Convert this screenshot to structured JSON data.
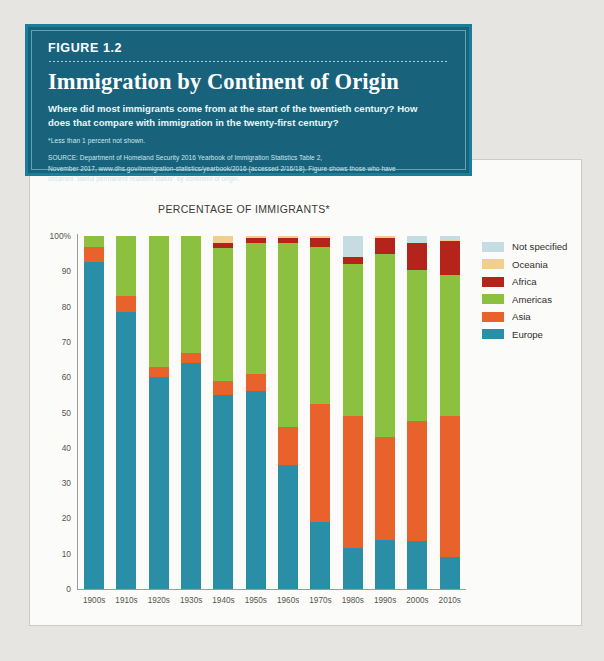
{
  "header": {
    "figure_label": "FIGURE 1.2",
    "title": "Immigration by Continent of Origin",
    "subtitle": "Where did most immigrants come from at the start of the twentieth century? How does that compare with immigration in the twenty-first century?",
    "footnote": "*Less than 1 percent not shown.",
    "source_lines": [
      "SOURCE: Department of Homeland Security 2016 Yearbook of Immigration Statistics Table 2,",
      "November 2017, www.dhs.gov/immigration-statistics/yearbook/2016 (accessed 2/16/18). Figure shows those who have",
      "obtained “lawful permanent resident status” by continent of origin."
    ],
    "panel_bg": "#18637b",
    "panel_border": "#1a7e99"
  },
  "chart_data": {
    "type": "bar",
    "stacked": true,
    "stack_total": 100,
    "title": "PERCENTAGE OF IMMIGRANTS*",
    "xlabel": "",
    "ylabel": "",
    "ylim": [
      0,
      100
    ],
    "grid": false,
    "legend_position": "right",
    "categories": [
      "1900s",
      "1910s",
      "1920s",
      "1930s",
      "1940s",
      "1950s",
      "1960s",
      "1970s",
      "1980s",
      "1990s",
      "2000s",
      "2010s"
    ],
    "ytick_labels": [
      "100%",
      "90",
      "80",
      "70",
      "60",
      "50",
      "40",
      "30",
      "20",
      "10",
      "0"
    ],
    "ytick_values": [
      100,
      90,
      80,
      70,
      60,
      50,
      40,
      30,
      20,
      10,
      0
    ],
    "series": [
      {
        "name": "Europe",
        "color": "#2a8ea6",
        "values": [
          92.5,
          78.5,
          60.0,
          64.0,
          55.0,
          56.0,
          35.0,
          19.0,
          11.5,
          14.0,
          13.5,
          9.0
        ]
      },
      {
        "name": "Asia",
        "color": "#e8622c",
        "values": [
          4.5,
          4.5,
          3.0,
          3.0,
          4.0,
          5.0,
          11.0,
          33.5,
          37.5,
          29.0,
          34.0,
          40.0
        ]
      },
      {
        "name": "Americas",
        "color": "#8cc13f",
        "values": [
          3.0,
          17.0,
          37.0,
          33.0,
          37.5,
          37.0,
          52.0,
          44.5,
          43.0,
          52.0,
          43.0,
          40.0
        ]
      },
      {
        "name": "Africa",
        "color": "#b4241a",
        "values": [
          0.0,
          0.0,
          0.0,
          0.0,
          1.5,
          1.5,
          1.5,
          2.5,
          2.0,
          4.5,
          7.5,
          9.5
        ]
      },
      {
        "name": "Oceania",
        "color": "#f0ce8e",
        "values": [
          0.0,
          0.0,
          0.0,
          0.0,
          2.0,
          0.5,
          0.5,
          0.5,
          0.0,
          0.5,
          0.0,
          0.5
        ]
      },
      {
        "name": "Not specified",
        "color": "#c6dce3",
        "values": [
          0.0,
          0.0,
          0.0,
          0.0,
          0.0,
          0.0,
          0.0,
          0.0,
          6.0,
          0.0,
          2.0,
          1.0
        ]
      }
    ],
    "legend": [
      {
        "label": "Not specified",
        "color": "#c6dce3"
      },
      {
        "label": "Oceania",
        "color": "#f0ce8e"
      },
      {
        "label": "Africa",
        "color": "#b4241a"
      },
      {
        "label": "Americas",
        "color": "#8cc13f"
      },
      {
        "label": "Asia",
        "color": "#e8622c"
      },
      {
        "label": "Europe",
        "color": "#2a8ea6"
      }
    ]
  }
}
